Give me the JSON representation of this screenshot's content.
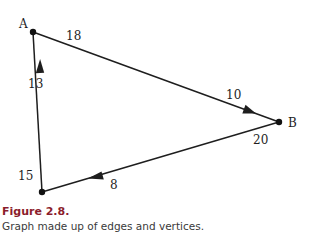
{
  "figure": {
    "title": "Figure 2.8.",
    "caption": "Graph made up of edges and vertices.",
    "title_color": "#8b1d2c"
  },
  "graph": {
    "vertices": [
      {
        "id": "A",
        "label": "A",
        "x": 33,
        "y": 32
      },
      {
        "id": "B",
        "label": "B",
        "x": 279,
        "y": 122
      },
      {
        "id": "C",
        "label": "C",
        "x": 42,
        "y": 192
      }
    ],
    "edges": [
      {
        "from": "A",
        "to": "B",
        "directed": true,
        "weight_labels": [
          "18",
          "10"
        ]
      },
      {
        "from": "B",
        "to": "C",
        "directed": true,
        "weight_labels": [
          "20",
          "8"
        ]
      },
      {
        "from": "C",
        "to": "A",
        "directed": true,
        "weight_labels": [
          "15",
          "13"
        ]
      }
    ],
    "labels": {
      "a": "A",
      "b": "B",
      "c": "C",
      "ab_start": "18",
      "ab_end": "10",
      "bc_start": "20",
      "bc_end": "8",
      "ca_start": "15",
      "ca_end": "13"
    }
  }
}
